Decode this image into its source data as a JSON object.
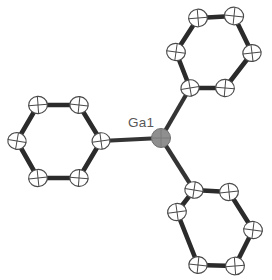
{
  "figure": {
    "kind": "ortep-thermal-ellipsoid-plot",
    "title": "Ga1",
    "background_color": "#ffffff",
    "width": 272,
    "height": 280
  },
  "labels": [
    {
      "id": "label-ga1",
      "text": "Ga1",
      "x": 128,
      "y": 127
    }
  ],
  "colors": {
    "metal_fill": "#8f8f8f",
    "metal_stroke": "#6e6e6e",
    "carbon_fill": "#ffffff",
    "carbon_stroke": "#4a4a4a",
    "ring_bond": "#2b2b2b",
    "metal_bond": "#343434",
    "label_text": "#585858"
  },
  "atoms": {
    "metal": {
      "name": "Ga1",
      "element": "Ga",
      "x": 161,
      "y": 138,
      "rx": 9.5,
      "ry": 9.5,
      "rot": 0
    },
    "carbons": [
      {
        "name": "C1",
        "ring": "left",
        "x": 101,
        "y": 141,
        "rx": 9.0,
        "ry": 8.2,
        "rot": -8
      },
      {
        "name": "C2",
        "ring": "left",
        "x": 79,
        "y": 105,
        "rx": 9.2,
        "ry": 8.4,
        "rot": 6
      },
      {
        "name": "C3",
        "ring": "left",
        "x": 38,
        "y": 105,
        "rx": 9.4,
        "ry": 8.6,
        "rot": -4
      },
      {
        "name": "C4",
        "ring": "left",
        "x": 17,
        "y": 141,
        "rx": 9.2,
        "ry": 8.4,
        "rot": 10
      },
      {
        "name": "C5",
        "ring": "left",
        "x": 38,
        "y": 178,
        "rx": 9.4,
        "ry": 8.6,
        "rot": -6
      },
      {
        "name": "C6",
        "ring": "left",
        "x": 79,
        "y": 178,
        "rx": 9.2,
        "ry": 8.4,
        "rot": 4
      },
      {
        "name": "C7",
        "ring": "top-right",
        "x": 190,
        "y": 88,
        "rx": 9.2,
        "ry": 8.2,
        "rot": -10
      },
      {
        "name": "C8",
        "ring": "top-right",
        "x": 176,
        "y": 52,
        "rx": 9.4,
        "ry": 8.6,
        "rot": 8
      },
      {
        "name": "C9",
        "ring": "top-right",
        "x": 198,
        "y": 18,
        "rx": 9.4,
        "ry": 8.8,
        "rot": -5
      },
      {
        "name": "C10",
        "ring": "top-right",
        "x": 234,
        "y": 16,
        "rx": 9.6,
        "ry": 8.8,
        "rot": 6
      },
      {
        "name": "C11",
        "ring": "top-right",
        "x": 252,
        "y": 53,
        "rx": 9.2,
        "ry": 8.4,
        "rot": -7
      },
      {
        "name": "C12",
        "ring": "top-right",
        "x": 225,
        "y": 88,
        "rx": 9.4,
        "ry": 8.6,
        "rot": 5
      },
      {
        "name": "C13",
        "ring": "bottom-right",
        "x": 194,
        "y": 190,
        "rx": 9.2,
        "ry": 8.2,
        "rot": 9
      },
      {
        "name": "C14",
        "ring": "bottom-right",
        "x": 229,
        "y": 192,
        "rx": 9.4,
        "ry": 8.6,
        "rot": -6
      },
      {
        "name": "C15",
        "ring": "bottom-right",
        "x": 253,
        "y": 230,
        "rx": 9.4,
        "ry": 8.6,
        "rot": 7
      },
      {
        "name": "C16",
        "ring": "bottom-right",
        "x": 235,
        "y": 266,
        "rx": 9.4,
        "ry": 8.8,
        "rot": -4
      },
      {
        "name": "C17",
        "ring": "bottom-right",
        "x": 198,
        "y": 265,
        "rx": 9.2,
        "ry": 8.4,
        "rot": 6
      },
      {
        "name": "C18",
        "ring": "bottom-right",
        "x": 177,
        "y": 212,
        "rx": 9.4,
        "ry": 8.6,
        "rot": -8
      }
    ]
  },
  "bonds": {
    "metal_bonds": [
      {
        "from": "Ga1",
        "to": "C1",
        "x1": 161,
        "y1": 138,
        "x2": 101,
        "y2": 141
      },
      {
        "from": "Ga1",
        "to": "C7",
        "x1": 161,
        "y1": 138,
        "x2": 190,
        "y2": 88
      },
      {
        "from": "Ga1",
        "to": "C13",
        "x1": 161,
        "y1": 138,
        "x2": 194,
        "y2": 190
      }
    ],
    "ring_bonds": [
      {
        "from": "C1",
        "to": "C2",
        "x1": 101,
        "y1": 141,
        "x2": 79,
        "y2": 105
      },
      {
        "from": "C2",
        "to": "C3",
        "x1": 79,
        "y1": 105,
        "x2": 38,
        "y2": 105
      },
      {
        "from": "C3",
        "to": "C4",
        "x1": 38,
        "y1": 105,
        "x2": 17,
        "y2": 141
      },
      {
        "from": "C4",
        "to": "C5",
        "x1": 17,
        "y1": 141,
        "x2": 38,
        "y2": 178
      },
      {
        "from": "C5",
        "to": "C6",
        "x1": 38,
        "y1": 178,
        "x2": 79,
        "y2": 178
      },
      {
        "from": "C6",
        "to": "C1",
        "x1": 79,
        "y1": 178,
        "x2": 101,
        "y2": 141
      },
      {
        "from": "C7",
        "to": "C8",
        "x1": 190,
        "y1": 88,
        "x2": 176,
        "y2": 52
      },
      {
        "from": "C8",
        "to": "C9",
        "x1": 176,
        "y1": 52,
        "x2": 198,
        "y2": 18
      },
      {
        "from": "C9",
        "to": "C10",
        "x1": 198,
        "y1": 18,
        "x2": 234,
        "y2": 16
      },
      {
        "from": "C10",
        "to": "C11",
        "x1": 234,
        "y1": 16,
        "x2": 252,
        "y2": 53
      },
      {
        "from": "C11",
        "to": "C12",
        "x1": 252,
        "y1": 53,
        "x2": 225,
        "y2": 88
      },
      {
        "from": "C12",
        "to": "C7",
        "x1": 225,
        "y1": 88,
        "x2": 190,
        "y2": 88
      },
      {
        "from": "C13",
        "to": "C14",
        "x1": 194,
        "y1": 190,
        "x2": 229,
        "y2": 192
      },
      {
        "from": "C14",
        "to": "C15",
        "x1": 229,
        "y1": 192,
        "x2": 253,
        "y2": 230
      },
      {
        "from": "C15",
        "to": "C16",
        "x1": 253,
        "y1": 230,
        "x2": 235,
        "y2": 266
      },
      {
        "from": "C16",
        "to": "C17",
        "x1": 235,
        "y1": 266,
        "x2": 198,
        "y2": 265
      },
      {
        "from": "C17",
        "to": "C18",
        "x1": 198,
        "y1": 265,
        "x2": 177,
        "y2": 212
      },
      {
        "from": "C18",
        "to": "C13",
        "x1": 177,
        "y1": 212,
        "x2": 194,
        "y2": 190
      }
    ]
  }
}
